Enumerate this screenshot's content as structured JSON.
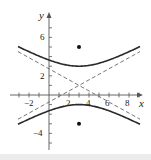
{
  "chart_data": {
    "type": "line",
    "title": "",
    "xlabel": "x",
    "ylabel": "y",
    "xlim": [
      -3.5,
      9.5
    ],
    "ylim": [
      -5.8,
      8.5
    ],
    "grid": false,
    "legend": null,
    "x_tick_labels": [
      "−2",
      "2",
      "4",
      "6",
      "8"
    ],
    "x_ticks": [
      -3,
      -2,
      -1,
      1,
      2,
      3,
      4,
      5,
      6,
      7,
      8,
      9
    ],
    "y_tick_labels": [
      "6",
      "2",
      "−4"
    ],
    "y_ticks": [
      -5,
      -4,
      -3,
      -2,
      -1,
      1,
      2,
      3,
      4,
      5,
      6,
      7
    ],
    "equation": "(y-1)^2/4 - (x-3)^2/12 = 1",
    "center": [
      3,
      1
    ],
    "vertices": [
      [
        3,
        3
      ],
      [
        3,
        -1
      ]
    ],
    "foci": [
      [
        3,
        5
      ],
      [
        3,
        -3
      ]
    ],
    "asymptotes": [
      "y - 1 = (1/√3)(x - 3)",
      "y - 1 = -(1/√3)(x - 3)"
    ],
    "series": [
      {
        "name": "upper branch",
        "style": "solid",
        "x_range": [
          -3,
          9
        ]
      },
      {
        "name": "lower branch",
        "style": "solid",
        "x_range": [
          -3,
          9
        ]
      },
      {
        "name": "asymptote positive slope",
        "style": "dashed",
        "x_range": [
          -3,
          9
        ]
      },
      {
        "name": "asymptote negative slope",
        "style": "dashed",
        "x_range": [
          -3,
          9
        ]
      },
      {
        "name": "foci",
        "style": "points",
        "points": [
          [
            3,
            5
          ],
          [
            3,
            -3
          ]
        ]
      }
    ]
  },
  "labels": {
    "x_axis": "x",
    "y_axis": "y",
    "x_ticks": {
      "m2": "−2",
      "p2": "2",
      "p4": "4",
      "p6": "6",
      "p8": "8"
    },
    "y_ticks": {
      "p6": "6",
      "p2": "2",
      "m4": "−4"
    }
  },
  "colors": {
    "curve": "#2a2a2a",
    "axes": "#555555",
    "dashed": "#666666",
    "strip": "#ececec"
  }
}
